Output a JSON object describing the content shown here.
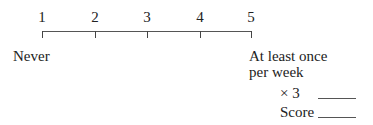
{
  "scale": {
    "points": [
      "1",
      "2",
      "3",
      "4",
      "5"
    ],
    "low_anchor": "Never",
    "high_anchor_line1": "At least once",
    "high_anchor_line2": "per week"
  },
  "scoring": {
    "multiplier_label": "× 3",
    "score_label": "Score",
    "multiplier_value": "",
    "score_value": ""
  }
}
